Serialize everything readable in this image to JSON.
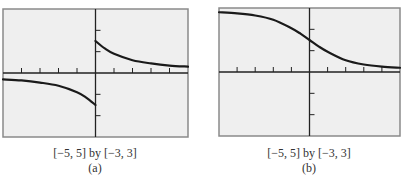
{
  "chart_data": [
    {
      "type": "line",
      "panel_label": "(a)",
      "window_caption": "[−5, 5] by [−3, 3]",
      "xlim": [
        -5,
        5
      ],
      "ylim": [
        -3,
        3
      ],
      "xticks": [
        -5,
        -4,
        -3,
        -2,
        -1,
        0,
        1,
        2,
        3,
        4,
        5
      ],
      "yticks": [
        -3,
        -2,
        -1,
        0,
        1,
        2,
        3
      ],
      "grid": false,
      "series": [
        {
          "name": "left-branch",
          "x": [
            -5,
            -4,
            -3,
            -2,
            -1,
            -0.5,
            0
          ],
          "y": [
            -0.3,
            -0.35,
            -0.45,
            -0.6,
            -0.9,
            -1.15,
            -1.5
          ]
        },
        {
          "name": "right-branch",
          "x": [
            0,
            0.5,
            1,
            2,
            3,
            4,
            5
          ],
          "y": [
            1.5,
            1.15,
            0.9,
            0.6,
            0.45,
            0.35,
            0.3
          ]
        }
      ]
    },
    {
      "type": "line",
      "panel_label": "(b)",
      "window_caption": "[−5, 5] by [−3, 3]",
      "xlim": [
        -5,
        5
      ],
      "ylim": [
        -3,
        3
      ],
      "xticks": [
        -5,
        -4,
        -3,
        -2,
        -1,
        0,
        1,
        2,
        3,
        4,
        5
      ],
      "yticks": [
        -3,
        -2,
        -1,
        0,
        1,
        2,
        3
      ],
      "grid": false,
      "series": [
        {
          "name": "curve",
          "x": [
            -5,
            -4,
            -3,
            -2,
            -1,
            -0.5,
            0,
            0.5,
            1,
            2,
            3,
            4,
            5
          ],
          "y": [
            2.8,
            2.75,
            2.65,
            2.45,
            2.05,
            1.8,
            1.5,
            1.2,
            0.95,
            0.55,
            0.35,
            0.25,
            0.2
          ]
        }
      ]
    }
  ]
}
